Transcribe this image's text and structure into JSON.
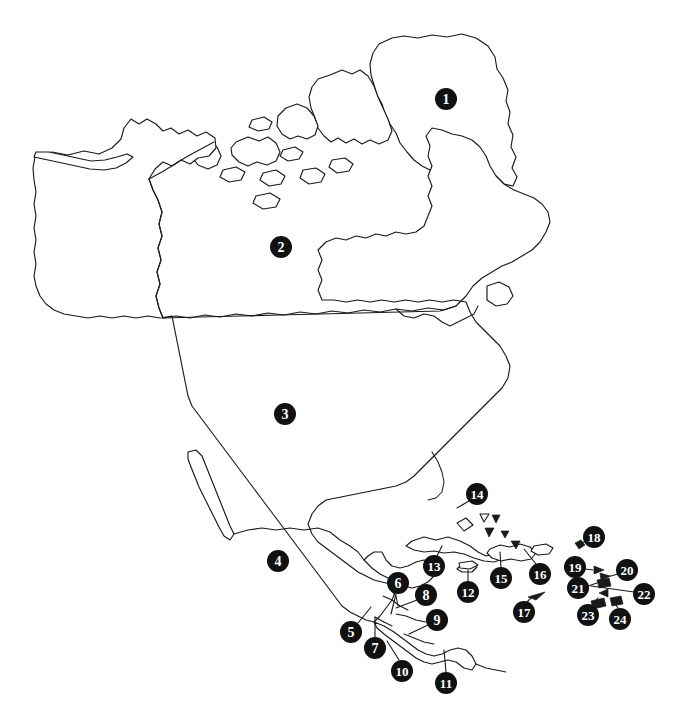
{
  "figure": {
    "name": "north-america-caribbean-numbered-map",
    "background_color": "#ffffff",
    "line_color": "#1a1a1a",
    "marker_fill_color": "#111111",
    "marker_text_color": "#ffffff",
    "width": 688,
    "height": 726
  },
  "markers": [
    {
      "number": "1",
      "x": 446,
      "y": 99,
      "r": 11,
      "font_size": 14,
      "leader": null
    },
    {
      "number": "2",
      "x": 281,
      "y": 247,
      "r": 11,
      "font_size": 14,
      "leader": null
    },
    {
      "number": "3",
      "x": 285,
      "y": 414,
      "r": 11,
      "font_size": 14,
      "leader": null
    },
    {
      "number": "4",
      "x": 278,
      "y": 561,
      "r": 11,
      "font_size": 14,
      "leader": null
    },
    {
      "number": "5",
      "x": 351,
      "y": 632,
      "r": 11,
      "font_size": 14,
      "leader": {
        "x1": 358,
        "y1": 623,
        "x2": 371,
        "y2": 607
      }
    },
    {
      "number": "6",
      "x": 398,
      "y": 583,
      "r": 11,
      "font_size": 14,
      "leader": {
        "x1": 396,
        "y1": 594,
        "x2": 391,
        "y2": 614
      }
    },
    {
      "number": "7",
      "x": 375,
      "y": 648,
      "r": 11,
      "font_size": 14,
      "leader": {
        "x1": 375,
        "y1": 637,
        "x2": 375,
        "y2": 617
      }
    },
    {
      "number": "8",
      "x": 426,
      "y": 595,
      "r": 11,
      "font_size": 14,
      "leader": {
        "x1": 417,
        "y1": 600,
        "x2": 396,
        "y2": 608
      }
    },
    {
      "number": "9",
      "x": 437,
      "y": 620,
      "r": 11,
      "font_size": 14,
      "leader": {
        "x1": 428,
        "y1": 625,
        "x2": 409,
        "y2": 634
      }
    },
    {
      "number": "10",
      "x": 402,
      "y": 671,
      "r": 11,
      "font_size": 13,
      "leader": {
        "x1": 399,
        "y1": 660,
        "x2": 387,
        "y2": 641
      }
    },
    {
      "number": "11",
      "x": 446,
      "y": 683,
      "r": 11,
      "font_size": 13,
      "leader": {
        "x1": 446,
        "y1": 672,
        "x2": 444,
        "y2": 650
      }
    },
    {
      "number": "12",
      "x": 468,
      "y": 592,
      "r": 11,
      "font_size": 13,
      "leader": {
        "x1": 468,
        "y1": 581,
        "x2": 468,
        "y2": 570
      }
    },
    {
      "number": "13",
      "x": 434,
      "y": 566,
      "r": 11,
      "font_size": 13,
      "leader": {
        "x1": 437,
        "y1": 556,
        "x2": 442,
        "y2": 546
      }
    },
    {
      "number": "14",
      "x": 477,
      "y": 494,
      "r": 11,
      "font_size": 13,
      "leader": {
        "x1": 469,
        "y1": 501,
        "x2": 457,
        "y2": 508
      }
    },
    {
      "number": "15",
      "x": 501,
      "y": 578,
      "r": 11,
      "font_size": 13,
      "leader": {
        "x1": 501,
        "y1": 567,
        "x2": 500,
        "y2": 552
      }
    },
    {
      "number": "16",
      "x": 540,
      "y": 574,
      "r": 11,
      "font_size": 13,
      "leader": {
        "x1": 536,
        "y1": 564,
        "x2": 524,
        "y2": 549
      }
    },
    {
      "number": "17",
      "x": 524,
      "y": 612,
      "r": 11,
      "font_size": 13,
      "leader": {
        "x1": 527,
        "y1": 602,
        "x2": 533,
        "y2": 596
      }
    },
    {
      "number": "18",
      "x": 594,
      "y": 537,
      "r": 11,
      "font_size": 13,
      "leader": {
        "x1": 586,
        "y1": 541,
        "x2": 578,
        "y2": 545
      }
    },
    {
      "number": "19",
      "x": 575,
      "y": 567,
      "r": 11,
      "font_size": 13,
      "leader": {
        "x1": 585,
        "y1": 569,
        "x2": 593,
        "y2": 570
      }
    },
    {
      "number": "20",
      "x": 627,
      "y": 570,
      "r": 11,
      "font_size": 13,
      "leader": {
        "x1": 618,
        "y1": 574,
        "x2": 607,
        "y2": 577
      }
    },
    {
      "number": "21",
      "x": 578,
      "y": 588,
      "r": 11,
      "font_size": 13,
      "leader": {
        "x1": 588,
        "y1": 586,
        "x2": 597,
        "y2": 583
      }
    },
    {
      "number": "22",
      "x": 644,
      "y": 594,
      "r": 11,
      "font_size": 13,
      "leader": {
        "x1": 634,
        "y1": 592,
        "x2": 591,
        "y2": 586
      }
    },
    {
      "number": "23",
      "x": 588,
      "y": 615,
      "r": 11,
      "font_size": 13,
      "leader": {
        "x1": 592,
        "y1": 605,
        "x2": 598,
        "y2": 598
      }
    },
    {
      "number": "24",
      "x": 620,
      "y": 619,
      "r": 11,
      "font_size": 13,
      "leader": {
        "x1": 618,
        "y1": 608,
        "x2": 613,
        "y2": 601
      }
    }
  ],
  "islets": [
    {
      "name": "islet-diamond-bahamas",
      "type": "open",
      "points": "457,523 466,518 473,525 464,531"
    },
    {
      "name": "islet-triangle-a",
      "type": "open",
      "points": "480,514 489,514 484,522"
    },
    {
      "name": "islet-triangle-b",
      "type": "solid",
      "points": "492,515 500,515 496,523"
    },
    {
      "name": "islet-triangle-c",
      "type": "solid",
      "points": "485,528 494,528 489,537"
    },
    {
      "name": "islet-triangle-d",
      "type": "solid",
      "points": "501,531 509,531 505,538"
    },
    {
      "name": "islet-triangle-e",
      "type": "solid",
      "points": "511,541 520,541 516,549"
    },
    {
      "name": "islet-diamond-leeward",
      "type": "solid",
      "points": "575,543 581,540 585,545 579,549"
    },
    {
      "name": "islet-triangle-f",
      "type": "solid",
      "points": "594,566 604,570 594,574"
    },
    {
      "name": "islet-quad-g",
      "type": "solid",
      "points": "597,580 609,578 611,586 599,588"
    },
    {
      "name": "islet-triangle-h",
      "type": "solid",
      "points": "600,573 610,576 601,580"
    },
    {
      "name": "islet-triangle-i",
      "type": "solid",
      "points": "599,593 608,589 608,597"
    },
    {
      "name": "islet-quad-j",
      "type": "solid",
      "points": "591,601 604,598 606,606 593,609"
    },
    {
      "name": "islet-quad-k",
      "type": "solid",
      "points": "610,598 621,596 623,604 612,606"
    },
    {
      "name": "islet-sliver-aruba",
      "type": "solid",
      "points": "528,597 545,592 536,600"
    },
    {
      "name": "islet-cayman",
      "type": "open",
      "points": "459,563 472,561 478,565 470,569 460,568"
    }
  ]
}
